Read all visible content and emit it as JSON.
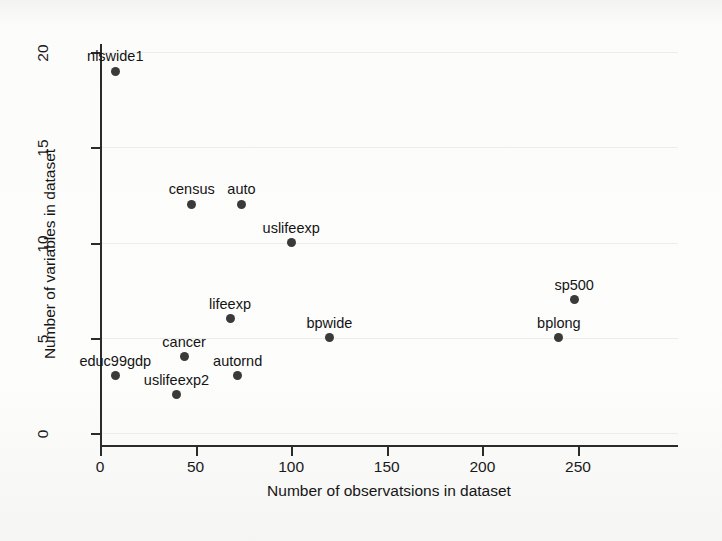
{
  "chart_data": {
    "type": "scatter",
    "title": "",
    "xlabel": "Number of observatsions in dataset",
    "ylabel": "Number of variables in dataset",
    "xlim": [
      0,
      255
    ],
    "ylim": [
      0,
      20.8
    ],
    "xticks": [
      0,
      50,
      100,
      150,
      200,
      250
    ],
    "yticks": [
      0,
      5,
      10,
      15,
      20
    ],
    "xtick_labels": [
      "0",
      "50",
      "100",
      "150",
      "200",
      "250"
    ],
    "ytick_labels": [
      "0",
      "5",
      "10",
      "15",
      "20"
    ],
    "grid": "light horizontal",
    "legend": "none",
    "marker": {
      "shape": "circle",
      "color": "#3a3a3a",
      "size_px": 9
    },
    "points": [
      {
        "label": "nlswide1",
        "x": 8,
        "y": 19,
        "label_anchor": "above"
      },
      {
        "label": "census",
        "x": 48,
        "y": 12,
        "label_anchor": "above"
      },
      {
        "label": "auto",
        "x": 74,
        "y": 12,
        "label_anchor": "above"
      },
      {
        "label": "uslifeexp",
        "x": 100,
        "y": 10,
        "label_anchor": "above"
      },
      {
        "label": "sp500",
        "x": 248,
        "y": 7,
        "label_anchor": "above"
      },
      {
        "label": "lifeexp",
        "x": 68,
        "y": 6,
        "label_anchor": "above"
      },
      {
        "label": "bpwide",
        "x": 120,
        "y": 5,
        "label_anchor": "above"
      },
      {
        "label": "bplong",
        "x": 240,
        "y": 5,
        "label_anchor": "above"
      },
      {
        "label": "cancer",
        "x": 44,
        "y": 4,
        "label_anchor": "above"
      },
      {
        "label": "educ99gdp",
        "x": 8,
        "y": 3,
        "label_anchor": "above"
      },
      {
        "label": "autornd",
        "x": 72,
        "y": 3,
        "label_anchor": "above"
      },
      {
        "label": "uslifeexp2",
        "x": 40,
        "y": 2,
        "label_anchor": "above"
      }
    ]
  },
  "colors": {
    "marker": "#3a3a3a",
    "axis": "#2b2b2b",
    "text": "#151515",
    "grid": "#ececeb",
    "background": "#fbfbfa"
  }
}
